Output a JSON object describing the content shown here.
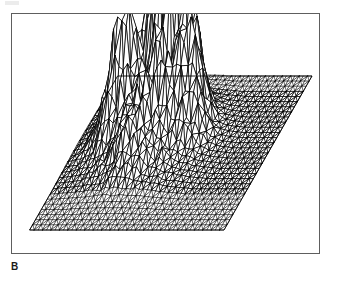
{
  "figure": {
    "panel_label": "B",
    "caption_text": "",
    "frame": {
      "x": 11,
      "y": 13,
      "width": 309,
      "height": 241,
      "border_color": "#5e5e5e",
      "background_color": "#ffffff"
    },
    "ink_color": "#000000"
  },
  "chart_data": {
    "type": "surface",
    "title": "",
    "subtitle": "",
    "xlabel": "",
    "ylabel": "",
    "zlabel": "",
    "legend": [],
    "annotations": [],
    "grid": false,
    "axes_visible": false,
    "tick_labels": {
      "x": [],
      "y": [],
      "z": []
    },
    "rendering": {
      "style": "wireframe-triangulated-mesh",
      "hidden_line_removal": true,
      "fill": "#ffffff",
      "stroke": "#000000",
      "stroke_width": 0.55,
      "projection": "oblique-parallelogram"
    },
    "base_plane": {
      "shape": "parallelogram",
      "corner_near_left": [
        18,
        216
      ],
      "corner_near_right": [
        212,
        216
      ],
      "corner_far_right": [
        300,
        62
      ],
      "corner_far_left": [
        106,
        62
      ],
      "grid_nx": 46,
      "grid_ny": 30
    },
    "surface_description": "Triangulated 3-D relief surface over a flat rectangular domain, viewed obliquely. Flat zero-level background occupies most of the domain and is drawn as a very dense fine triangular mesh. A broad raised mound rises from the left-of-centre region and is crowned by one very tall narrow spike near the upper-left, accompanied by several shorter secondary spikes.",
    "peaks": [
      {
        "name": "primary-spike",
        "u": 0.3,
        "v": 0.74,
        "height": 1.0
      },
      {
        "name": "secondary-spike-1",
        "u": 0.38,
        "v": 0.7,
        "height": 0.58
      },
      {
        "name": "secondary-spike-2",
        "u": 0.45,
        "v": 0.72,
        "height": 0.52
      },
      {
        "name": "secondary-spike-3",
        "u": 0.5,
        "v": 0.68,
        "height": 0.47
      },
      {
        "name": "shoulder-left",
        "u": 0.22,
        "v": 0.62,
        "height": 0.4
      },
      {
        "name": "shoulder-left-low",
        "u": 0.19,
        "v": 0.55,
        "height": 0.32
      },
      {
        "name": "ridge-mid",
        "u": 0.4,
        "v": 0.55,
        "height": 0.3
      },
      {
        "name": "ridge-right",
        "u": 0.56,
        "v": 0.6,
        "height": 0.26
      },
      {
        "name": "foot-low",
        "u": 0.34,
        "v": 0.4,
        "height": 0.15
      }
    ],
    "zlim": [
      0,
      1
    ],
    "xlim": [
      0,
      1
    ],
    "ylim": [
      0,
      1
    ]
  }
}
